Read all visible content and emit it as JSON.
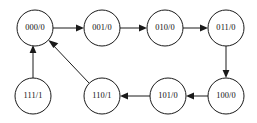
{
  "diagram": {
    "type": "state-transition-diagram",
    "title": "",
    "width": 257,
    "height": 123,
    "background_color": "#ffffff",
    "stroke_color": "#1a1a1a",
    "label_color": "#111111",
    "node_radius": 18,
    "nodes": [
      {
        "id": "n000",
        "label": "000/0",
        "cx": 35,
        "cy": 28
      },
      {
        "id": "n001",
        "label": "001/0",
        "cx": 102,
        "cy": 28
      },
      {
        "id": "n010",
        "label": "010/0",
        "cx": 165,
        "cy": 28
      },
      {
        "id": "n011",
        "label": "011/0",
        "cx": 226,
        "cy": 28
      },
      {
        "id": "n111",
        "label": "111/1",
        "cx": 33,
        "cy": 96
      },
      {
        "id": "n110",
        "label": "110/1",
        "cx": 102,
        "cy": 96
      },
      {
        "id": "n101",
        "label": "101/0",
        "cx": 168,
        "cy": 96
      },
      {
        "id": "n100",
        "label": "100/0",
        "cx": 226,
        "cy": 96
      }
    ],
    "edges": [
      {
        "id": "e1",
        "from": "000/0",
        "to": "001/0",
        "shape": "horizontal",
        "direction": "right"
      },
      {
        "id": "e2",
        "from": "001/0",
        "to": "010/0",
        "shape": "horizontal",
        "direction": "right"
      },
      {
        "id": "e3",
        "from": "010/0",
        "to": "011/0",
        "shape": "horizontal",
        "direction": "right"
      },
      {
        "id": "e4",
        "from": "011/0",
        "to": "100/0",
        "shape": "vertical",
        "direction": "down"
      },
      {
        "id": "e5",
        "from": "100/0",
        "to": "101/0",
        "shape": "horizontal",
        "direction": "left"
      },
      {
        "id": "e6",
        "from": "101/0",
        "to": "110/1",
        "shape": "horizontal",
        "direction": "left"
      },
      {
        "id": "e7",
        "from": "110/1",
        "to": "000/0",
        "shape": "diagonal",
        "direction": "up-left"
      },
      {
        "id": "e8",
        "from": "111/1",
        "to": "000/0",
        "shape": "vertical",
        "direction": "up"
      }
    ]
  }
}
